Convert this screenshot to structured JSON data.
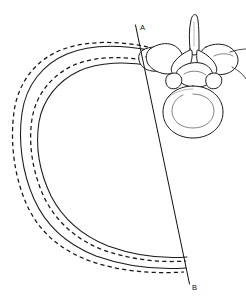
{
  "figure": {
    "background_color": "#ffffff",
    "ink_color": "#1a1a1a",
    "width": 246,
    "height": 305
  },
  "labels": {
    "reference_line_top": "A",
    "reference_line_bottom": "B"
  },
  "reference_line": {
    "name": "A-B",
    "from_label": "A",
    "to_label": "B",
    "x1": 135.5,
    "y1": 25.0,
    "x2": 189.5,
    "y2": 284.0,
    "style": "solid"
  },
  "rib_arcs": [
    {
      "id": "arc-outer-dashed",
      "style": "dashed",
      "description": "outermost rib position, dashed"
    },
    {
      "id": "arc-outer-solid",
      "style": "solid",
      "description": "outer rib position, solid"
    },
    {
      "id": "arc-inner-dashed",
      "style": "dashed",
      "description": "inner rib position, dashed"
    },
    {
      "id": "arc-inner-solid",
      "style": "solid",
      "description": "innermost rib position, solid"
    }
  ],
  "vertebra": {
    "name": "thoracic-vertebra",
    "view": "superior",
    "parts": [
      "spinous-process",
      "lamina",
      "transverse-process-left",
      "transverse-process-right",
      "superior-articular-process",
      "vertebral-foramen",
      "vertebral-body",
      "costal-facet"
    ]
  },
  "ribs_attached": [
    {
      "id": "rib-left-head",
      "side": "left"
    },
    {
      "id": "rib-right-head",
      "side": "right"
    }
  ]
}
